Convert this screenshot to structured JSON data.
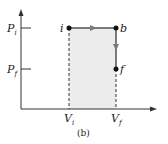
{
  "figure": {
    "caption": "(b)",
    "axes": {
      "y_ticks": [
        {
          "main": "P",
          "sub": "i"
        },
        {
          "main": "P",
          "sub": "f"
        }
      ],
      "x_ticks": [
        {
          "main": "V",
          "sub": "i"
        },
        {
          "main": "V",
          "sub": "f"
        }
      ]
    },
    "points": [
      {
        "label": "i"
      },
      {
        "label": "b"
      },
      {
        "label": "f"
      }
    ],
    "colors": {
      "axis": "#333333",
      "path": "#7a7a7a",
      "shade": "#ececec",
      "point": "#111111"
    }
  }
}
